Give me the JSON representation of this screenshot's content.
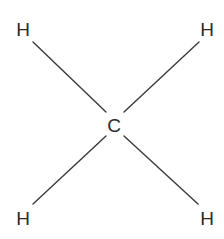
{
  "molecule": {
    "name": "methane structural formula",
    "center": {
      "label": "C",
      "x": 114,
      "y": 132
    },
    "atoms": [
      {
        "label": "H",
        "x": 23,
        "y": 36
      },
      {
        "label": "H",
        "x": 207,
        "y": 36
      },
      {
        "label": "H",
        "x": 23,
        "y": 225
      },
      {
        "label": "H",
        "x": 207,
        "y": 225
      }
    ],
    "bonds": [
      {
        "x1": 33,
        "y1": 42,
        "x2": 106,
        "y2": 112
      },
      {
        "x1": 199,
        "y1": 42,
        "x2": 124,
        "y2": 112
      },
      {
        "x1": 106,
        "y1": 136,
        "x2": 33,
        "y2": 204
      },
      {
        "x1": 124,
        "y1": 136,
        "x2": 198,
        "y2": 204
      }
    ],
    "colors": {
      "text": "#2a2a2a",
      "bond": "#3a3a3a",
      "background": "#ffffff"
    }
  }
}
